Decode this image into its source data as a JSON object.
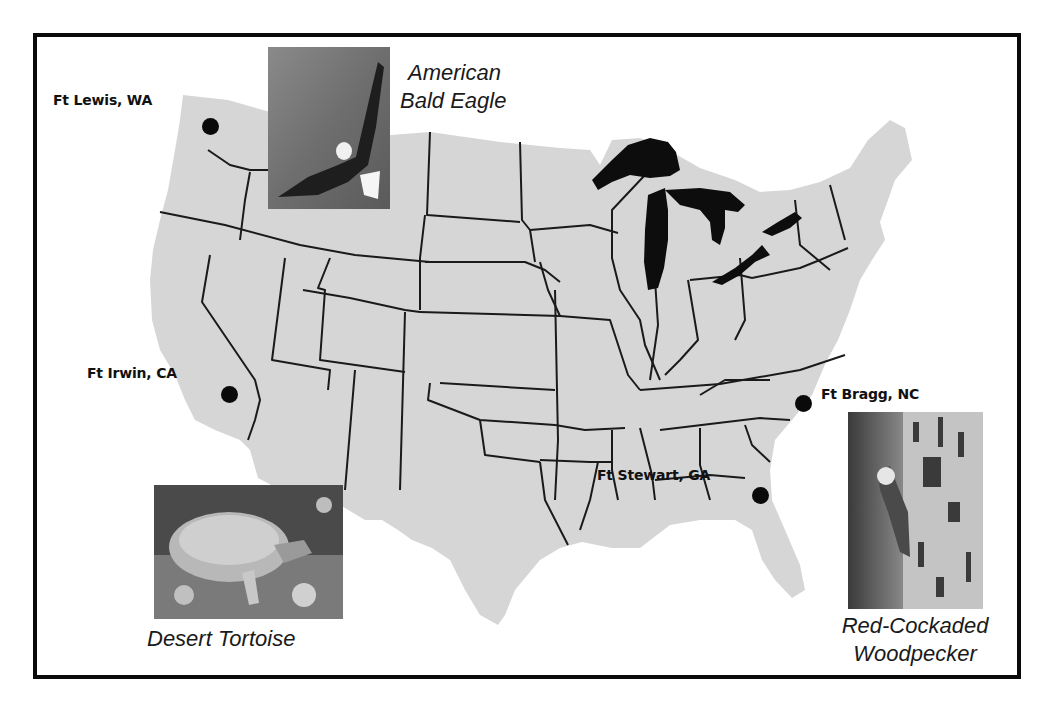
{
  "map": {
    "title": "",
    "region": "Contiguous United States",
    "colors": {
      "land": "#d6d6d6",
      "state_borders": "#1a1a1a",
      "great_lakes": "#0d0d0d",
      "frame": "#0a0a0a",
      "markers": "#0a0a0a"
    }
  },
  "sites": [
    {
      "id": "ft-lewis",
      "label": "Ft Lewis, WA"
    },
    {
      "id": "ft-irwin",
      "label": "Ft Irwin, CA"
    },
    {
      "id": "ft-bragg",
      "label": "Ft Bragg, NC"
    },
    {
      "id": "ft-stewart",
      "label": "Ft Stewart, GA"
    }
  ],
  "species": [
    {
      "id": "eagle",
      "caption_line1": "American",
      "caption_line2": "Bald Eagle",
      "photo_icon": "bald-eagle-photo"
    },
    {
      "id": "tortoise",
      "caption_line1": "Desert Tortoise",
      "photo_icon": "desert-tortoise-photo"
    },
    {
      "id": "woodpecker",
      "caption_line1": "Red-Cockaded",
      "caption_line2": "Woodpecker",
      "photo_icon": "red-cockaded-woodpecker-photo"
    }
  ]
}
